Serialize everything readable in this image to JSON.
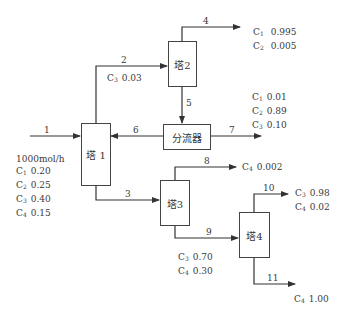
{
  "units": {
    "tower1": "塔 1",
    "tower2": "塔2",
    "tower3": "塔3",
    "tower4": "塔4",
    "splitter": "分流器"
  },
  "streams": {
    "s1": "1",
    "s2": "2",
    "s3": "3",
    "s4": "4",
    "s5": "5",
    "s6": "6",
    "s7": "7",
    "s8": "8",
    "s9": "9",
    "s10": "10",
    "s11": "11"
  },
  "feed": {
    "flow": "1000mol/h",
    "components": [
      {
        "name": "C",
        "sub": "1",
        "value": "0.20"
      },
      {
        "name": "C",
        "sub": "2",
        "value": "0.25"
      },
      {
        "name": "C",
        "sub": "3",
        "value": "0.40"
      },
      {
        "name": "C",
        "sub": "4",
        "value": "0.15"
      }
    ]
  },
  "stream2": {
    "components": [
      {
        "name": "C",
        "sub": "3",
        "value": "0.03"
      }
    ]
  },
  "stream4": {
    "components": [
      {
        "name": "C",
        "sub": "1",
        "value": "0.995"
      },
      {
        "name": "C",
        "sub": "2",
        "value": "0.005"
      }
    ]
  },
  "stream7": {
    "components": [
      {
        "name": "C",
        "sub": "1",
        "value": "0.01"
      },
      {
        "name": "C",
        "sub": "2",
        "value": "0.89"
      },
      {
        "name": "C",
        "sub": "3",
        "value": "0.10"
      }
    ]
  },
  "stream8": {
    "components": [
      {
        "name": "C",
        "sub": "4",
        "value": "0.002"
      }
    ]
  },
  "stream9": {
    "components": [
      {
        "name": "C",
        "sub": "3",
        "value": "0.70"
      },
      {
        "name": "C",
        "sub": "4",
        "value": "0.30"
      }
    ]
  },
  "stream10": {
    "components": [
      {
        "name": "C",
        "sub": "3",
        "value": "0.98"
      },
      {
        "name": "C",
        "sub": "4",
        "value": "0.02"
      }
    ]
  },
  "stream11": {
    "components": [
      {
        "name": "C",
        "sub": "4",
        "value": "1.00"
      }
    ]
  },
  "colors": {
    "line": "#333333",
    "text": "#3a3a3a"
  }
}
